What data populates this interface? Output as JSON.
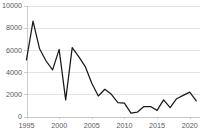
{
  "chart_data": {
    "type": "line",
    "title": "",
    "xlabel": "",
    "ylabel": "",
    "x": [
      1995,
      1996,
      1997,
      1998,
      1999,
      2000,
      2001,
      2002,
      2003,
      2004,
      2005,
      2006,
      2007,
      2008,
      2009,
      2010,
      2011,
      2012,
      2013,
      2014,
      2015,
      2016,
      2017,
      2018,
      2019,
      2020,
      2021
    ],
    "values": [
      5100,
      8600,
      6100,
      5000,
      4200,
      6050,
      1500,
      6200,
      5400,
      4500,
      3000,
      1850,
      2450,
      2000,
      1250,
      1200,
      300,
      400,
      900,
      900,
      550,
      1500,
      800,
      1600,
      1900,
      2200,
      1400
    ],
    "series": [
      {
        "name": "series-1",
        "color": "#1a1a1a",
        "points": [
          {
            "x": 1995,
            "y": 5100
          },
          {
            "x": 1996,
            "y": 8600
          },
          {
            "x": 1997,
            "y": 6100
          },
          {
            "x": 1998,
            "y": 5000
          },
          {
            "x": 1999,
            "y": 4200
          },
          {
            "x": 2000,
            "y": 6050
          },
          {
            "x": 2001,
            "y": 1500
          },
          {
            "x": 2002,
            "y": 6200
          },
          {
            "x": 2003,
            "y": 5400
          },
          {
            "x": 2004,
            "y": 4500
          },
          {
            "x": 2005,
            "y": 3000
          },
          {
            "x": 2006,
            "y": 1850
          },
          {
            "x": 2007,
            "y": 2450
          },
          {
            "x": 2008,
            "y": 2000
          },
          {
            "x": 2009,
            "y": 1250
          },
          {
            "x": 2010,
            "y": 1200
          },
          {
            "x": 2011,
            "y": 300
          },
          {
            "x": 2012,
            "y": 400
          },
          {
            "x": 2013,
            "y": 900
          },
          {
            "x": 2014,
            "y": 900
          },
          {
            "x": 2015,
            "y": 550
          },
          {
            "x": 2016,
            "y": 1500
          },
          {
            "x": 2017,
            "y": 800
          },
          {
            "x": 2018,
            "y": 1600
          },
          {
            "x": 2019,
            "y": 1900
          },
          {
            "x": 2020,
            "y": 2200
          },
          {
            "x": 2021,
            "y": 1400
          }
        ]
      }
    ],
    "ylim": [
      0,
      10000
    ],
    "xlim": [
      1995,
      2021.5
    ],
    "y_ticks": [
      0,
      2000,
      4000,
      6000,
      8000,
      10000
    ],
    "y_tick_labels": [
      "0",
      "2000",
      "4000",
      "6000",
      "8000",
      "10000"
    ],
    "x_ticks": [
      1995,
      2000,
      2005,
      2010,
      2015,
      2020
    ],
    "x_tick_labels": [
      "1995",
      "2000",
      "2005",
      "2010",
      "2015",
      "2020"
    ],
    "grid": true,
    "grid_color": "#d9d9d9",
    "axis_color": "#bfbfbf",
    "legend": false,
    "legend_position": "none",
    "background_color": "#ffffff",
    "tick_label_color": "#595959"
  }
}
